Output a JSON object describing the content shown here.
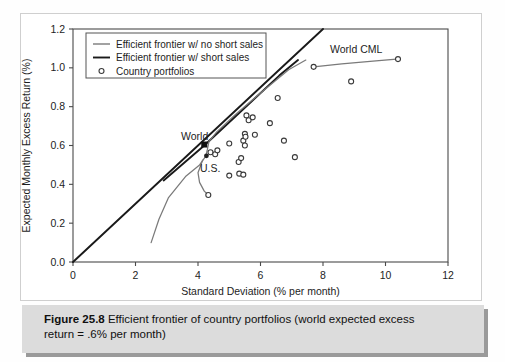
{
  "figure": {
    "caption_label": "Figure 25.8",
    "caption_text": "Efficient frontier of country portfolios (world expected excess",
    "caption_text_line2": "return = .6% per month)"
  },
  "annotations": {
    "world_cml": "World CML",
    "world": "World",
    "us": "U.S."
  },
  "colors": {
    "short_sales_line": "#1a1a1a",
    "no_short_sales_line": "#7a7a7a",
    "marker_stroke": "#3a3a3a",
    "frame": "#4a4a4a",
    "caption_band": "#dcdcdc"
  },
  "chart_data": {
    "type": "scatter",
    "title": "",
    "xlabel": "Standard Deviation (% per month)",
    "ylabel": "Expected Monthly Excess Return (%)",
    "xlim": [
      0,
      12
    ],
    "ylim": [
      0.0,
      1.2
    ],
    "xticks": [
      0,
      2,
      4,
      6,
      8,
      10,
      12
    ],
    "yticks": [
      "0.0",
      "0.2",
      "0.4",
      "0.6",
      "0.8",
      "1.0",
      "1.2"
    ],
    "grid": false,
    "legend_position": "top-left",
    "legend": [
      {
        "label": "Efficient frontier w/ no short sales",
        "type": "line",
        "color": "#7a7a7a"
      },
      {
        "label": "Efficient frontier w/ short sales",
        "type": "line",
        "color": "#1a1a1a"
      },
      {
        "label": "Country portfolios",
        "type": "marker",
        "color": "#3a3a3a"
      }
    ],
    "series": [
      {
        "name": "World CML",
        "type": "line",
        "color": "#1a1a1a",
        "points": [
          [
            0.0,
            0.0
          ],
          [
            8.0,
            1.2
          ]
        ]
      },
      {
        "name": "Efficient frontier w/ short sales",
        "type": "line",
        "color": "#1a1a1a",
        "points": [
          [
            2.9,
            0.42
          ],
          [
            4.2,
            0.6
          ],
          [
            5.6,
            0.81
          ],
          [
            6.6,
            0.96
          ],
          [
            7.2,
            1.04
          ]
        ]
      },
      {
        "name": "Efficient frontier w/ no short sales",
        "type": "line",
        "color": "#7a7a7a",
        "points": [
          [
            2.5,
            0.1
          ],
          [
            2.75,
            0.22
          ],
          [
            3.05,
            0.33
          ],
          [
            3.6,
            0.44
          ],
          [
            4.05,
            0.5
          ],
          [
            4.25,
            0.545
          ],
          [
            4.3,
            0.58
          ],
          [
            4.35,
            0.62
          ],
          [
            4.6,
            0.67
          ],
          [
            5.2,
            0.76
          ],
          [
            6.0,
            0.87
          ],
          [
            6.9,
            0.99
          ],
          [
            7.45,
            1.04
          ]
        ]
      },
      {
        "name": "No-short-sales lower branch",
        "type": "line",
        "color": "#7a7a7a",
        "points": [
          [
            4.15,
            0.525
          ],
          [
            4.0,
            0.46
          ],
          [
            4.05,
            0.41
          ],
          [
            4.2,
            0.365
          ],
          [
            4.33,
            0.345
          ]
        ]
      },
      {
        "name": "Upper flat frontier to rightmost",
        "type": "line",
        "color": "#7a7a7a",
        "points": [
          [
            7.7,
            1.005
          ],
          [
            8.6,
            1.02
          ],
          [
            9.6,
            1.035
          ],
          [
            10.35,
            1.045
          ]
        ]
      },
      {
        "name": "Country portfolios",
        "type": "scatter",
        "color": "#3a3a3a",
        "points": [
          [
            4.33,
            0.345
          ],
          [
            4.4,
            0.565
          ],
          [
            4.55,
            0.555
          ],
          [
            4.62,
            0.575
          ],
          [
            5.0,
            0.445
          ],
          [
            5.0,
            0.61
          ],
          [
            5.3,
            0.515
          ],
          [
            5.32,
            0.455
          ],
          [
            5.38,
            0.535
          ],
          [
            5.45,
            0.45
          ],
          [
            5.45,
            0.625
          ],
          [
            5.5,
            0.66
          ],
          [
            5.5,
            0.6
          ],
          [
            5.52,
            0.645
          ],
          [
            5.55,
            0.755
          ],
          [
            5.62,
            0.73
          ],
          [
            5.75,
            0.745
          ],
          [
            5.82,
            0.655
          ],
          [
            6.3,
            0.715
          ],
          [
            6.55,
            0.845
          ],
          [
            6.75,
            0.625
          ],
          [
            7.1,
            0.54
          ],
          [
            7.7,
            1.005
          ],
          [
            8.9,
            0.93
          ],
          [
            10.4,
            1.045
          ]
        ]
      },
      {
        "name": "World portfolio",
        "type": "marker-filled-square",
        "color": "#101010",
        "points": [
          [
            4.2,
            0.605
          ]
        ]
      },
      {
        "name": "U.S. portfolio",
        "type": "marker-filled",
        "color": "#202020",
        "points": [
          [
            4.27,
            0.547
          ]
        ]
      }
    ]
  }
}
